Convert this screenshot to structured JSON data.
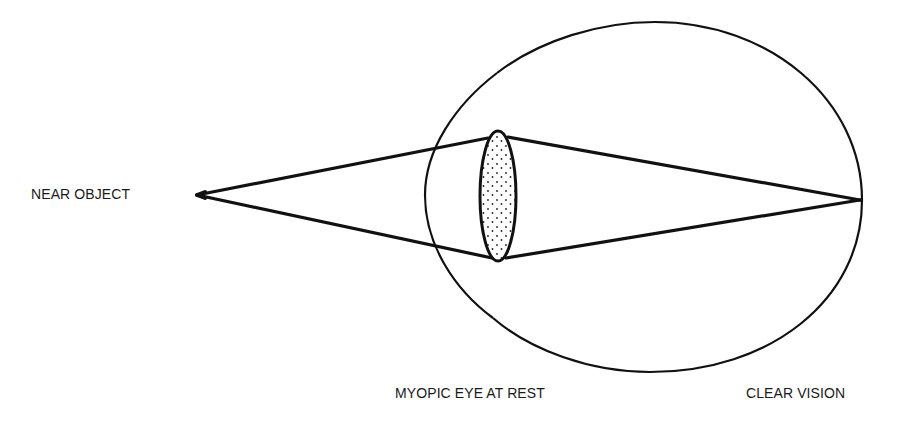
{
  "diagram": {
    "labels": {
      "near_object": "NEAR OBJECT",
      "eye_state": "MYOPIC EYE AT REST",
      "result": "CLEAR VISION"
    },
    "colors": {
      "stroke": "#111111",
      "background": "#ffffff",
      "lens_dots": "#222222"
    },
    "elements": [
      {
        "id": "object-point",
        "description": "Near object point (apex of light cone)",
        "x": 197,
        "y": 195
      },
      {
        "id": "eyeball",
        "description": "Eyeball outline with corneal bulge"
      },
      {
        "id": "lens",
        "description": "Stippled crystalline lens (relaxed)"
      },
      {
        "id": "rays-incoming",
        "description": "Diverging rays from near object to lens"
      },
      {
        "id": "rays-refracted",
        "description": "Rays converging from lens to focus on retina"
      },
      {
        "id": "focal-point",
        "description": "Focus point on retina",
        "x": 860,
        "y": 200
      }
    ]
  }
}
